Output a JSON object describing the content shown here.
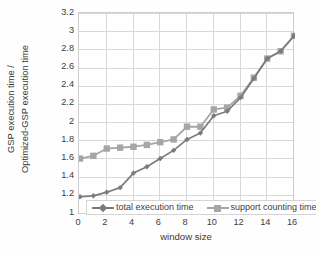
{
  "chart_data": {
    "type": "line",
    "title": "",
    "xlabel": "window size",
    "ylabel": "GSP execution  time / Optimized-GSP execution time",
    "ylabel_lines": [
      "GSP execution  time /",
      "Optimized-GSP execution time"
    ],
    "xlim": [
      0,
      16
    ],
    "ylim": [
      1,
      3.2
    ],
    "grid": true,
    "legend_position": "bottom-inside",
    "xticks": [
      0,
      2,
      4,
      6,
      8,
      10,
      12,
      14,
      16
    ],
    "xtick_labels": [
      "0",
      "2",
      "4",
      "6",
      "8",
      "10",
      "12",
      "14",
      "16"
    ],
    "yticks": [
      1,
      1.2,
      1.4,
      1.6,
      1.8,
      2,
      2.2,
      2.4,
      2.6,
      2.8,
      3,
      3.2
    ],
    "ytick_labels": [
      "1",
      "1.2",
      "1.4",
      "1.6",
      "1.8",
      "2",
      "2.2",
      "2.4",
      "2.6",
      "2.8",
      "3",
      "3.2"
    ],
    "x": [
      0,
      1,
      2,
      3,
      4,
      5,
      6,
      7,
      8,
      9,
      10,
      11,
      12,
      13,
      14,
      15,
      16
    ],
    "series": [
      {
        "name": "total execution time",
        "marker": "diamond",
        "color": "#7b7b7b",
        "values": [
          1.19,
          1.2,
          1.24,
          1.29,
          1.45,
          1.52,
          1.61,
          1.7,
          1.82,
          1.89,
          2.08,
          2.13,
          2.28,
          2.49,
          2.71,
          2.79,
          2.96
        ]
      },
      {
        "name": "support counting time",
        "marker": "square",
        "color": "#a6a6a6",
        "values": [
          1.61,
          1.64,
          1.72,
          1.73,
          1.74,
          1.76,
          1.79,
          1.82,
          1.96,
          1.96,
          2.15,
          2.17,
          2.3,
          2.5,
          2.71,
          2.79,
          2.96
        ]
      }
    ]
  },
  "legend": {
    "items": [
      {
        "label": "total execution time"
      },
      {
        "label": "support counting time"
      }
    ]
  },
  "colors": {
    "series_total": "#7b7b7b",
    "series_support": "#a6a6a6",
    "grid": "#d8d8d8",
    "frame": "#cdcdcd",
    "text": "#3d3d3d"
  }
}
